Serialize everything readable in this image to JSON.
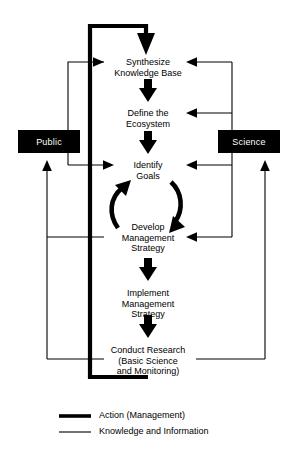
{
  "diagram": {
    "background_color": "#ffffff",
    "line_color": "#000000",
    "actor_fill_color": "#000000",
    "actor_text_color": "#ffffff",
    "nodes": [
      {
        "id": "synthesize",
        "label": "Synthesize\nKnowledge Base"
      },
      {
        "id": "define",
        "label": "Define the\nEcosystem"
      },
      {
        "id": "identify",
        "label": "Identify\nGoals"
      },
      {
        "id": "develop",
        "label": "Develop\nManagement\nStrategy"
      },
      {
        "id": "implement",
        "label": "Implement\nManagement\nStrategy"
      },
      {
        "id": "conduct",
        "label": "Conduct Research\n(Basic Science\nand Monitoring)"
      }
    ],
    "actors": [
      {
        "id": "public",
        "label": "Public"
      },
      {
        "id": "science",
        "label": "Science"
      }
    ]
  },
  "legend": {
    "items": [
      {
        "id": "action",
        "label": "Action (Management)",
        "style": "thick"
      },
      {
        "id": "knowledge",
        "label": "Knowledge and Information",
        "style": "thin"
      }
    ]
  }
}
